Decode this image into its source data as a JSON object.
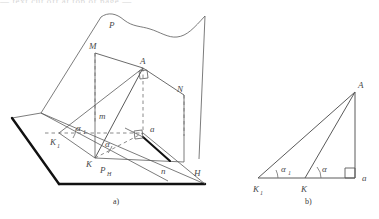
{
  "figure": {
    "title_strip": "— text cut off at top of page —",
    "captions": [
      {
        "id": "caption-a",
        "text": "a)",
        "x": 113,
        "y": 202
      },
      {
        "id": "caption-b",
        "text": "b)",
        "x": 305,
        "y": 202
      }
    ]
  },
  "panel_a": {
    "name": "spatial-projection-diagram",
    "labels": [
      {
        "id": "label-P",
        "text": "P",
        "sub": "",
        "x": 109,
        "y": 24
      },
      {
        "id": "label-M",
        "text": "M",
        "sub": "",
        "x": 102,
        "y": 48
      },
      {
        "id": "label-A",
        "text": "A",
        "sub": "",
        "x": 141,
        "y": 67
      },
      {
        "id": "label-N",
        "text": "N",
        "sub": "",
        "x": 176,
        "y": 92
      },
      {
        "id": "label-m",
        "text": "m",
        "sub": "",
        "x": 103,
        "y": 116
      },
      {
        "id": "label-a-small",
        "text": "a",
        "sub": "",
        "x": 147,
        "y": 135
      },
      {
        "id": "label-alpha1",
        "text": "α",
        "sub": "1",
        "x": 77,
        "y": 131
      },
      {
        "id": "label-alpha",
        "text": "α",
        "sub": "",
        "x": 106,
        "y": 144
      },
      {
        "id": "label-K1",
        "text": "K",
        "sub": "1",
        "x": 55,
        "y": 142
      },
      {
        "id": "label-K",
        "text": "K",
        "sub": "",
        "x": 89,
        "y": 159
      },
      {
        "id": "label-PH",
        "text": "P",
        "sub": "H",
        "x": 103,
        "y": 172
      },
      {
        "id": "label-n",
        "text": "n",
        "sub": "",
        "x": 164,
        "y": 171
      },
      {
        "id": "label-H",
        "text": "H",
        "sub": "",
        "x": 198,
        "y": 174
      }
    ],
    "geometry": {
      "plane_H_outline": "12,118 41,113 205,184 59,184",
      "plane_H_thick_left": "12,118 59,184",
      "plane_H_thick_bottom": "59,184 205,184",
      "plane_P_outline": "41,113 101,17 205,16 199,159",
      "wavy_top_edge": "101,17 111,13 124,21 140,25 158,30 172,36 186,34 196,29 205,16",
      "trace_PH": "41,113 168,180",
      "line_MA": "95,53 143,68",
      "line_AN": "143,68 184,95",
      "line_MK": "95,53 95,158",
      "line_NK": "184,95 184,162",
      "dashed_M_drop": "95,53 95,122",
      "dashed_N_drop": "184,95 184,135",
      "dashed_A_drop": "143,68 143,133",
      "dashed_K1_a": "59,133 143,133",
      "line_K1_A": "59,133 143,68",
      "line_K_A": "95,158 143,68",
      "line_K1_K": "59,133 95,158",
      "dashed_K_a": "95,158 143,133",
      "line_a_n": "143,133 170,160",
      "line_H_edge": "143,133 205,184",
      "right_angle_A": "at A on KA / AN",
      "right_angle_a": "at a on Ka / an"
    }
  },
  "panel_b": {
    "name": "plane-triangle-diagram",
    "labels": [
      {
        "id": "label-b-A",
        "text": "A",
        "sub": "",
        "x": 358,
        "y": 86
      },
      {
        "id": "label-b-alpha1",
        "text": "α",
        "sub": "1",
        "x": 283,
        "y": 170
      },
      {
        "id": "label-b-alpha",
        "text": "α",
        "sub": "",
        "x": 323,
        "y": 170
      },
      {
        "id": "label-b-K1",
        "text": "K",
        "sub": "1",
        "x": 256,
        "y": 191
      },
      {
        "id": "label-b-K",
        "text": "K",
        "sub": "",
        "x": 303,
        "y": 191
      },
      {
        "id": "label-b-a",
        "text": "a",
        "sub": "",
        "x": 366,
        "y": 180
      }
    ],
    "geometry": {
      "vertex_K1": "258,178",
      "vertex_K": "305,178",
      "vertex_a": "355,178",
      "vertex_A": "355,92",
      "side_base": "258,178 355,178",
      "side_vertical": "355,178 355,92",
      "hyp_K1_A": "258,178 355,92",
      "hyp_K_A": "305,178 355,92",
      "right_angle_marker": "at a"
    }
  },
  "style": {
    "stroke": "#4d4d4d",
    "stroke_dark": "#111111",
    "label_color": "#4a4a4a",
    "background": "#ffffff"
  }
}
